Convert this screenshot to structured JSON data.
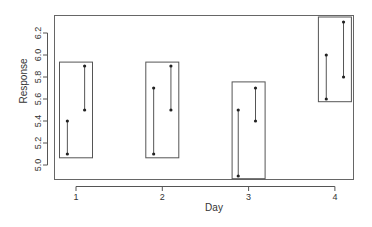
{
  "chart_data": {
    "type": "scatter",
    "title": "",
    "xlabel": "Day",
    "ylabel": "Response",
    "x_ticks": [
      "1",
      "2",
      "3",
      "4"
    ],
    "y_ticks": [
      "5.0",
      "5.2",
      "5.4",
      "5.6",
      "5.8",
      "6.0",
      "6.2"
    ],
    "ylim": [
      4.87,
      6.33
    ],
    "xlim": [
      0.78,
      4.22
    ],
    "grid": false,
    "legend": null,
    "groups": [
      {
        "day": 1,
        "pairs": [
          {
            "x_offset": -0.1,
            "low": 5.1,
            "high": 5.4
          },
          {
            "x_offset": 0.1,
            "low": 5.5,
            "high": 5.9
          }
        ],
        "box": {
          "low": 5.07,
          "high": 5.94
        }
      },
      {
        "day": 2,
        "pairs": [
          {
            "x_offset": -0.1,
            "low": 5.1,
            "high": 5.7
          },
          {
            "x_offset": 0.1,
            "low": 5.5,
            "high": 5.9
          }
        ],
        "box": {
          "low": 5.07,
          "high": 5.94
        }
      },
      {
        "day": 3,
        "pairs": [
          {
            "x_offset": -0.12,
            "low": 4.9,
            "high": 5.5
          },
          {
            "x_offset": 0.08,
            "low": 5.4,
            "high": 5.7
          }
        ],
        "box": {
          "low": 4.88,
          "high": 5.76
        }
      },
      {
        "day": 4,
        "pairs": [
          {
            "x_offset": -0.1,
            "low": 5.6,
            "high": 6.0
          },
          {
            "x_offset": 0.1,
            "low": 5.8,
            "high": 6.3
          }
        ],
        "box": {
          "low": 5.58,
          "high": 6.35
        }
      }
    ]
  }
}
